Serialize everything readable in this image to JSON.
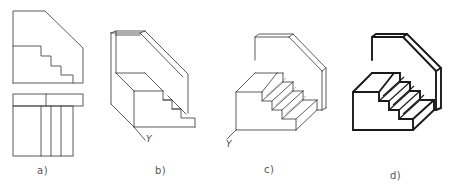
{
  "figure": {
    "panels": [
      {
        "id": "a",
        "label": "a)",
        "kind": "orthographic front and top views"
      },
      {
        "id": "b",
        "label": "b)",
        "kind": "isometric construction (thin lines)",
        "axis_label": "Y"
      },
      {
        "id": "c",
        "label": "c)",
        "kind": "isometric with step treads",
        "axis_label": "Y"
      },
      {
        "id": "d",
        "label": "d)",
        "kind": "final isometric with bold outlines"
      }
    ],
    "colors": {
      "background": "#ffffff",
      "thin_line": "#4a4a4a",
      "bold_line": "#1a1a1a",
      "label_text": "#555555"
    }
  }
}
